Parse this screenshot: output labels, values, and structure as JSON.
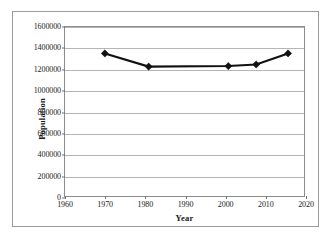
{
  "chart_data": {
    "type": "line",
    "title": "",
    "xlabel": "Year",
    "ylabel": "Population",
    "xlim": [
      1960,
      2020
    ],
    "ylim": [
      0,
      1600000
    ],
    "xticks": [
      1960,
      1970,
      1980,
      1990,
      2000,
      2010,
      2020
    ],
    "xtick_labels": [
      "1960",
      "1970",
      "1980",
      "1990",
      "2000",
      "2010",
      "2020"
    ],
    "yticks": [
      0,
      200000,
      400000,
      600000,
      800000,
      1000000,
      1200000,
      1400000,
      1600000
    ],
    "ytick_labels": [
      "0",
      "200000",
      "400000",
      "600000",
      "800000",
      "1000000",
      "1200000",
      "1400000",
      "1600000"
    ],
    "grid": "horizontal",
    "legend": "none",
    "series": [
      {
        "name": "Population",
        "marker": "diamond",
        "color": "#111111",
        "x": [
          1970,
          1981,
          2001,
          2008,
          2016
        ],
        "values": [
          1350000,
          1225000,
          1230000,
          1245000,
          1350000
        ],
        "points": [
          {
            "x": 1970,
            "y": 1350000
          },
          {
            "x": 1981,
            "y": 1225000
          },
          {
            "x": 2001,
            "y": 1230000
          },
          {
            "x": 2008,
            "y": 1245000
          },
          {
            "x": 2016,
            "y": 1350000
          }
        ]
      }
    ]
  },
  "colors": {
    "series": "#111111",
    "gridline": "#b5b5b5",
    "axis": "#8d8d8d",
    "border": "#9a9a9a",
    "background": "#ffffff"
  }
}
